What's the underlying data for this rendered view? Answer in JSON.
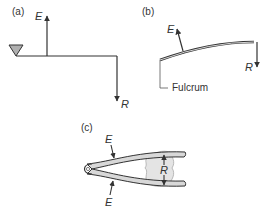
{
  "panels": {
    "a": {
      "label": "(a)",
      "effort": "E",
      "resistance": "R"
    },
    "b": {
      "label": "(b)",
      "effort": "E",
      "resistance": "R",
      "fulcrum_label": "Fulcrum"
    },
    "c": {
      "label": "(c)",
      "effort_top": "E",
      "effort_bottom": "E",
      "resistance": "R"
    }
  },
  "colors": {
    "line": "#333333",
    "fulcrum_fill": "#b0b0b0",
    "load_fill": "#e4e4e4"
  }
}
